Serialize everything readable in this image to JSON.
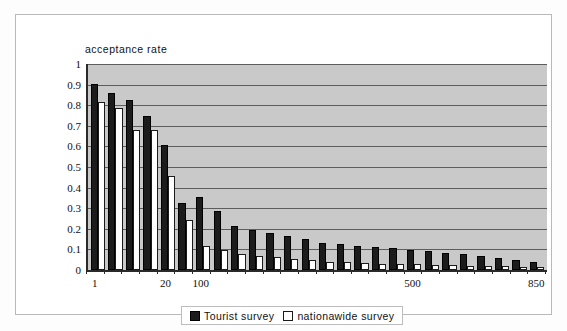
{
  "chart_data": {
    "type": "bar",
    "title": "",
    "ylabel": "acceptance rate",
    "xlabel": "",
    "ylim": [
      0,
      1
    ],
    "grid": true,
    "legend_position": "bottom",
    "ytick_labels": [
      "1",
      "0.9",
      "0.8",
      "0.7",
      "0.6",
      "0.5",
      "0.4",
      "0.3",
      "0.2",
      "0.1",
      "0"
    ],
    "ytick_values": [
      1,
      0.9,
      0.8,
      0.7,
      0.6,
      0.5,
      0.4,
      0.3,
      0.2,
      0.1,
      0
    ],
    "xtick_labels": [
      "1",
      "20",
      "100",
      "500",
      "850"
    ],
    "xtick_indices": [
      0,
      4,
      6,
      18,
      25
    ],
    "n_categories": 26,
    "series": [
      {
        "name": "Tourist survey",
        "color": "#1c1c1c",
        "values": [
          0.905,
          0.857,
          0.826,
          0.748,
          0.608,
          0.325,
          0.355,
          0.288,
          0.215,
          0.196,
          0.18,
          0.163,
          0.152,
          0.133,
          0.126,
          0.118,
          0.112,
          0.107,
          0.097,
          0.092,
          0.085,
          0.078,
          0.068,
          0.06,
          0.05,
          0.038
        ]
      },
      {
        "name": "nationawide survey",
        "color": "#ffffff",
        "values": [
          0.815,
          0.787,
          0.68,
          0.68,
          0.455,
          0.245,
          0.115,
          0.098,
          0.077,
          0.07,
          0.063,
          0.054,
          0.048,
          0.04,
          0.037,
          0.033,
          0.031,
          0.03,
          0.027,
          0.026,
          0.023,
          0.021,
          0.02,
          0.018,
          0.017,
          0.016
        ]
      }
    ]
  },
  "legend": {
    "entries": [
      {
        "label": "Tourist survey",
        "marker": "filled-square"
      },
      {
        "label": "nationawide survey",
        "marker": "open-square"
      }
    ]
  },
  "colors": {
    "plot_background": "#c9c9c9",
    "gridline": "#5d5d5d",
    "axis": "#2a2a2a",
    "page_background": "#ffffff",
    "frame_border": "#b9b9b9"
  }
}
